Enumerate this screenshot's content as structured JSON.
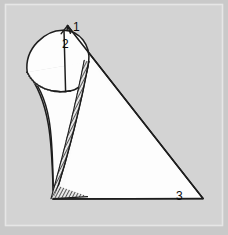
{
  "figure": {
    "type": "line-art-geometric-diagram",
    "canvas": {
      "width": 228,
      "height": 235
    },
    "background_color": "#c9c9c9",
    "plate_color": "#d2d2d2",
    "border_color": "#e2e2e2",
    "ink_color": "#1a1a1a",
    "fill_color": "#fdfdfd",
    "shade_color": "#b8b8b8",
    "hatch_color": "#2b2b2b"
  },
  "labels": [
    {
      "id": "label-1",
      "text": "1",
      "x": 73,
      "y": 27,
      "description": "apex-of-triangle"
    },
    {
      "id": "label-2",
      "text": "2",
      "x": 64,
      "y": 44,
      "description": "apex-of-cone"
    },
    {
      "id": "label-3",
      "text": "3",
      "x": 178,
      "y": 196,
      "description": "right-vertex-of-triangle"
    }
  ],
  "geometry": {
    "triangle": {
      "name": "triangular-plane",
      "vertices": [
        {
          "label": "1",
          "x": 67.5,
          "y": 25.5
        },
        {
          "label": "3",
          "x": 203.0,
          "y": 198.5
        },
        {
          "label": "base-left",
          "x": 53.0,
          "y": 199.0
        }
      ]
    },
    "cone": {
      "name": "oblique-cone",
      "apex": {
        "label": "2",
        "x": 63.5,
        "y": 30.0
      },
      "tip": {
        "x": 53.5,
        "y": 198.5
      },
      "base_ellipse": {
        "center_x": 63.0,
        "center_y": 68.5,
        "radius_x": 36.0,
        "radius_y": 22.0,
        "rotation_deg": -7
      }
    },
    "tangent_seam": {
      "name": "hatched-contact-line",
      "from": {
        "x": 88.0,
        "y": 62.0
      },
      "to": {
        "x": 54.0,
        "y": 198.0
      }
    }
  }
}
